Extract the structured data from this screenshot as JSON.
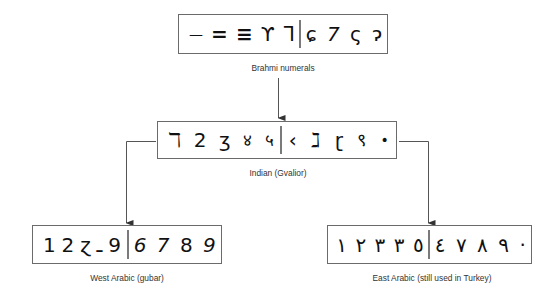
{
  "diagram": {
    "nodes": [
      {
        "id": "brahmi",
        "label": "Brahmi numerals",
        "left_glyphs": [
          "—",
          "=",
          "≡",
          "ϒ",
          "ᒣ"
        ],
        "right_glyphs": [
          "ɕ",
          "7",
          "ς",
          "ɂ"
        ]
      },
      {
        "id": "indian",
        "label": "Indian (Gvalior)",
        "left_glyphs": [
          "ℸ",
          "2",
          "ʒ",
          "४",
          "५"
        ],
        "right_glyphs": [
          "‹",
          "ℷ",
          "ɽ",
          "९",
          "•"
        ]
      },
      {
        "id": "west_arabic",
        "label": "West Arabic (gubar)",
        "left_glyphs": [
          "1",
          "2",
          "ɀ",
          "ـ",
          "9"
        ],
        "right_glyphs": [
          "6",
          "7",
          "8",
          "9"
        ]
      },
      {
        "id": "east_arabic",
        "label": "East Arabic (still used in Turkey)",
        "left_glyphs": [
          "١",
          "٢",
          "٣",
          "٣",
          "٥"
        ],
        "right_glyphs": [
          "٤",
          "٧",
          "٨",
          "٩",
          "·"
        ]
      }
    ],
    "edges": [
      {
        "from": "brahmi",
        "to": "indian"
      },
      {
        "from": "indian",
        "to": "west_arabic"
      },
      {
        "from": "indian",
        "to": "east_arabic"
      }
    ],
    "colors": {
      "line": "#555555",
      "box_border": "#6b6b6b",
      "text": "#333333"
    }
  }
}
